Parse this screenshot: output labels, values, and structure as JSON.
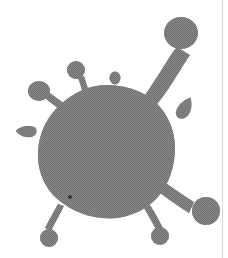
{
  "image": {
    "title": "Virus particle illustration",
    "subject": "virus-particle",
    "style": "halftone-dithered-grayscale-line-art",
    "width": 228,
    "height": 258,
    "background_color": "#ffffff",
    "body_color": "#7d7d7d",
    "halftone_dark": "#636363",
    "halftone_light": "#9a9a9a",
    "nucleus_dot_color": "#3a3a3a",
    "edge_rule_color": "#d8d8d8"
  },
  "shapes": {
    "capsid": {
      "name": "capsid-body",
      "description": "large irregular round central mass",
      "center_x": 107,
      "center_y": 152,
      "radius_x": 69,
      "radius_y": 67
    },
    "nucleus_dot": {
      "name": "nucleus-dot",
      "x": 70,
      "y": 197,
      "radius": 2
    },
    "spikes": [
      {
        "name": "spike-upper-right-long",
        "head_x": 181,
        "head_y": 33,
        "head_radius": 17,
        "base_x": 148,
        "base_y": 100,
        "stalk_width": 13
      },
      {
        "name": "spike-top-center",
        "head_x": 76,
        "head_y": 70,
        "head_radius": 9,
        "base_x": 88,
        "base_y": 104,
        "stalk_width": 5
      },
      {
        "name": "spike-upper-left",
        "head_x": 39,
        "head_y": 91,
        "head_radius": 11,
        "base_x": 70,
        "base_y": 116,
        "stalk_width": 6
      },
      {
        "name": "spike-lower-right",
        "head_x": 206,
        "head_y": 211,
        "head_radius": 14,
        "base_x": 164,
        "base_y": 184,
        "stalk_width": 9
      },
      {
        "name": "spike-bottom-center",
        "head_x": 160,
        "head_y": 236,
        "head_radius": 9,
        "base_x": 147,
        "base_y": 209,
        "stalk_width": 5
      },
      {
        "name": "spike-bottom-left",
        "head_x": 49,
        "head_y": 238,
        "head_radius": 9,
        "base_x": 62,
        "base_y": 207,
        "stalk_width": 5
      }
    ],
    "detached_particles": [
      {
        "name": "detached-particle-right-teardrop",
        "x": 185,
        "y": 108,
        "width": 15,
        "height": 23,
        "rotation": 28
      },
      {
        "name": "detached-particle-left-teardrop",
        "x": 25,
        "y": 130,
        "width": 19,
        "height": 11,
        "rotation": 8
      },
      {
        "name": "detached-particle-top-oval",
        "x": 115,
        "y": 78,
        "width": 11,
        "height": 13,
        "rotation": 0
      }
    ]
  },
  "labels": {
    "caption": "",
    "alt_text": "Grayscale halftone illustration of a virus particle with a large round body and six club-shaped surface spikes plus three detached particles"
  }
}
